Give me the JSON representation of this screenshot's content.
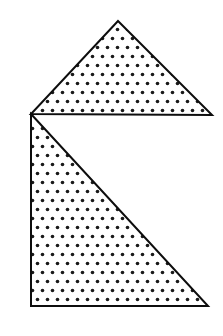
{
  "canvas": {
    "width": 223,
    "height": 336,
    "background_color": "#ffffff",
    "title": "Two stippled triangles forming a notched house-like figure"
  },
  "style": {
    "outline_color": "#0d0d0d",
    "outline_width": 2,
    "fill_base_color": "#ffffff",
    "stipple_dot_color": "#1a1a1a",
    "stipple_dot_radius": 1.8,
    "stipple_pitch_x": 10,
    "stipple_pitch_y": 9,
    "stipple_row_offset": 5
  },
  "shapes": [
    {
      "id": "upper-triangle",
      "name": "upper-triangle",
      "label": "Upper triangle",
      "kind": "triangle",
      "fill": "stipple",
      "points": "118,21 212,115 31,114",
      "vertices": [
        {
          "label": "apex",
          "x": 118,
          "y": 21
        },
        {
          "label": "right-base",
          "x": 212,
          "y": 115
        },
        {
          "label": "left-base",
          "x": 31,
          "y": 114
        }
      ]
    },
    {
      "id": "lower-triangle",
      "name": "lower-triangle",
      "label": "Lower right triangle",
      "kind": "right-triangle",
      "fill": "stipple",
      "points": "31,114 208,306 31,306",
      "vertices": [
        {
          "label": "top-left",
          "x": 31,
          "y": 114
        },
        {
          "label": "bottom-right",
          "x": 208,
          "y": 306
        },
        {
          "label": "bottom-left",
          "x": 31,
          "y": 306
        }
      ]
    }
  ]
}
